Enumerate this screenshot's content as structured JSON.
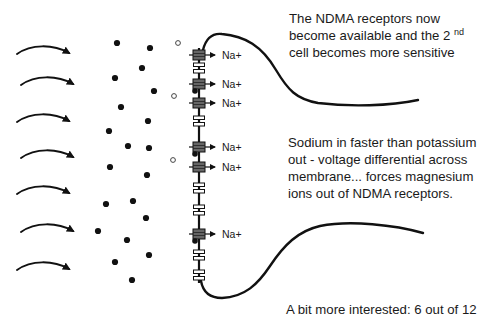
{
  "diagram": {
    "colors": {
      "ink": "#111111",
      "channel_open": "#666666",
      "channel_closed": "#ffffff",
      "background": "#ffffff"
    },
    "inflow_arrows": {
      "count": 7,
      "y": [
        52,
        83,
        120,
        156,
        192,
        230,
        268
      ]
    },
    "ions": {
      "filled_dots": [
        [
          117,
          43
        ],
        [
          150,
          48
        ],
        [
          142,
          68
        ],
        [
          115,
          78
        ],
        [
          154,
          91
        ],
        [
          121,
          107
        ],
        [
          148,
          121
        ],
        [
          109,
          131
        ],
        [
          128,
          146
        ],
        [
          149,
          148
        ],
        [
          110,
          167
        ],
        [
          147,
          175
        ],
        [
          106,
          204
        ],
        [
          133,
          201
        ],
        [
          146,
          218
        ],
        [
          98,
          231
        ],
        [
          127,
          240
        ],
        [
          149,
          255
        ],
        [
          115,
          262
        ],
        [
          132,
          280
        ]
      ],
      "open_circles": [
        [
          178,
          43
        ],
        [
          174,
          96
        ],
        [
          173,
          160
        ]
      ]
    },
    "membrane": {
      "x": 199,
      "channels": [
        {
          "y": 55,
          "state": "open",
          "label": "Na+",
          "magnesium": false
        },
        {
          "y": 68,
          "state": "closed",
          "label": "",
          "magnesium": false
        },
        {
          "y": 84,
          "state": "open",
          "label": "Na+",
          "magnesium": true
        },
        {
          "y": 103,
          "state": "open",
          "label": "Na+",
          "magnesium": false
        },
        {
          "y": 121,
          "state": "closed",
          "label": "",
          "magnesium": false
        },
        {
          "y": 147,
          "state": "open",
          "label": "Na+",
          "magnesium": true
        },
        {
          "y": 167,
          "state": "open",
          "label": "Na+",
          "magnesium": false
        },
        {
          "y": 188,
          "state": "closed",
          "label": "",
          "magnesium": false
        },
        {
          "y": 210,
          "state": "closed",
          "label": "",
          "magnesium": false
        },
        {
          "y": 234,
          "state": "open",
          "label": "Na+",
          "magnesium": true
        },
        {
          "y": 255,
          "state": "closed",
          "label": "",
          "magnesium": false
        },
        {
          "y": 275,
          "state": "closed",
          "label": "",
          "magnesium": false
        }
      ]
    },
    "labels": {
      "na": "Na+"
    },
    "notes": {
      "top": {
        "line1": "The NDMA receptors now",
        "line2_pre": "become available and the 2 ",
        "line2_sup": "nd",
        "line3": "cell becomes more sensitive"
      },
      "middle": {
        "line1": "Sodium in faster than potassium",
        "line2": "out - voltage differential across",
        "line3": "membrane... forces magnesium",
        "line4": "ions out of NDMA receptors."
      },
      "bottom": {
        "line1": "A bit more interested: 6 out of 12"
      }
    }
  }
}
